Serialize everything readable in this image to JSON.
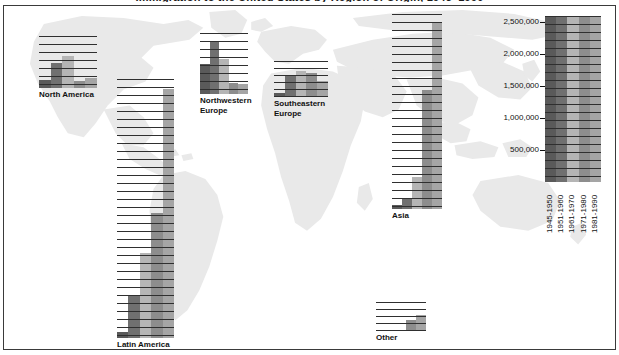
{
  "title": "Immigration to the United States by Region of Origin, 1945–1990",
  "legend": {
    "name": "scale-legend",
    "axis_ticks": [
      "2,500,000",
      "2,000,000",
      "1,500,000",
      "1,000,000",
      "500,000"
    ],
    "axis_tick_values": [
      2500000,
      2000000,
      1500000,
      1000000,
      500000
    ],
    "periods": [
      "1945-1950",
      "1951-1960",
      "1961-1970",
      "1971-1980",
      "1981-1990"
    ]
  },
  "colors": {
    "period_1945_1950": "#5a5a5a",
    "period_1951_1960": "#707070",
    "period_1961_1970": "#b5b5b5",
    "period_1971_1980": "#8d8d8d",
    "period_1981_1990": "#a5a5a5",
    "gridline": "#2f2f2f",
    "map_land": "#e9e9e9",
    "frame": "#3a3a3a",
    "text": "#111111"
  },
  "chart_data": {
    "type": "bar",
    "title": "Immigration to the United States by Region of Origin, 1945–1990",
    "xlabel": "",
    "ylabel": "",
    "ylim": [
      0,
      2600000
    ],
    "grid": true,
    "legend_position": "right",
    "categories": [
      "1945-1950",
      "1951-1960",
      "1961-1970",
      "1971-1980",
      "1981-1990"
    ],
    "panels": [
      {
        "name": "North America",
        "label": "North America",
        "values": [
          200000,
          620000,
          800000,
          170000,
          250000
        ],
        "ymax": 1300000
      },
      {
        "name": "Northwestern Europe",
        "label": "Northwestern\nEurope",
        "values": [
          690000,
          1200000,
          800000,
          260000,
          220000
        ],
        "ymax": 1400000
      },
      {
        "name": "Southeastern Europe",
        "label": "Southeastern\nEurope",
        "values": [
          70000,
          420000,
          500000,
          450000,
          300000
        ],
        "ymax": 680000
      },
      {
        "name": "Latin America",
        "label": "Latin America",
        "values": [
          60000,
          420000,
          850000,
          1250000,
          2500000
        ],
        "ymax": 2600000
      },
      {
        "name": "Asia",
        "label": "Asia",
        "values": [
          50000,
          140000,
          430000,
          1590000,
          2500000
        ],
        "ymax": 2600000
      },
      {
        "name": "Other",
        "label": "Other",
        "values": [
          5000,
          10000,
          15000,
          120000,
          180000
        ],
        "ymax": 320000
      }
    ]
  },
  "panel_layout": [
    {
      "key": "North America",
      "x": 35,
      "y": 30,
      "w": 58,
      "h": 52,
      "lx": 35,
      "ly": 84,
      "gridstep": 8
    },
    {
      "key": "Northwestern Europe",
      "x": 196,
      "y": 27,
      "w": 48,
      "h": 61,
      "lx": 196,
      "ly": 90,
      "gridstep": 8
    },
    {
      "key": "Southeastern Europe",
      "x": 270,
      "y": 55,
      "w": 54,
      "h": 36,
      "lx": 270,
      "ly": 93,
      "gridstep": 7
    },
    {
      "key": "Latin America",
      "x": 113,
      "y": 73,
      "w": 57,
      "h": 259,
      "lx": 113,
      "ly": 334,
      "gridstep": 8
    },
    {
      "key": "Asia",
      "x": 388,
      "y": 8,
      "w": 50,
      "h": 195,
      "lx": 388,
      "ly": 205,
      "gridstep": 8
    },
    {
      "key": "Other",
      "x": 372,
      "y": 296,
      "w": 50,
      "h": 29,
      "lx": 372,
      "ly": 327,
      "gridstep": 7
    }
  ],
  "legend_layout": {
    "x": 541,
    "y": 10,
    "w": 56,
    "h": 166,
    "gridstep": 8
  }
}
